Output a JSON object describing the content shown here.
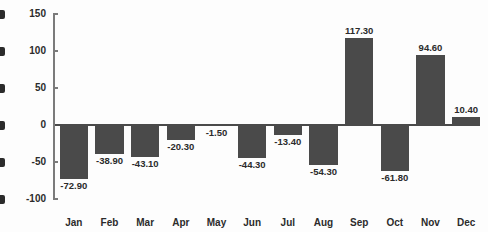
{
  "chart_data": {
    "type": "bar",
    "title": "",
    "subtitle": "",
    "xlabel": "",
    "ylabel": "",
    "categories": [
      "Jan",
      "Feb",
      "Mar",
      "Apr",
      "May",
      "Jun",
      "Jul",
      "Aug",
      "Sep",
      "Oct",
      "Nov",
      "Dec"
    ],
    "values": [
      -72.9,
      -38.9,
      -43.1,
      -20.3,
      -1.5,
      -44.3,
      -13.4,
      -54.3,
      117.3,
      -61.8,
      94.6,
      10.4
    ],
    "data_labels": [
      "-72.90",
      "-38.90",
      "-43.10",
      "-20.30",
      "-1.50",
      "-44.30",
      "-13.40",
      "-54.30",
      "117.30",
      "-61.80",
      "94.60",
      "10.40"
    ],
    "ylim": [
      -100,
      150
    ],
    "yticks": [
      150,
      100,
      50,
      0,
      -50,
      -100
    ],
    "ytick_labels": [
      "150",
      "100",
      "50",
      "0",
      "-50",
      "-100"
    ],
    "grid": false,
    "legend": false,
    "legend_position": "none",
    "bar_color": "#4a4a4a",
    "axis_color": "#7b7b7b",
    "text_color": "#2b2b2b",
    "background_color": "#fdfdfd",
    "zero_line_color": "#4a4a4a"
  },
  "edge_fragments": [
    {
      "name": "edge-fragment-150"
    },
    {
      "name": "edge-fragment-100"
    },
    {
      "name": "edge-fragment-50"
    },
    {
      "name": "edge-fragment-0"
    },
    {
      "name": "edge-fragment-neg50"
    },
    {
      "name": "edge-fragment-neg100"
    }
  ]
}
